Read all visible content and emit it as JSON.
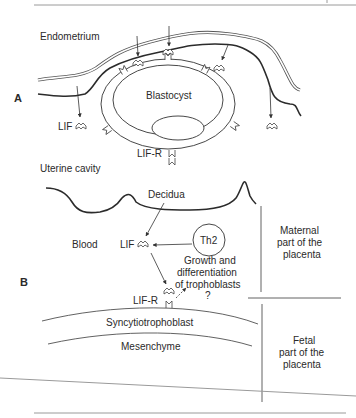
{
  "figure": {
    "panel_a": {
      "label": "A",
      "tissue_label": "Endometrium",
      "blastocyst_label": "Blastocyst",
      "lif_label": "LIF",
      "lif_r_label": "LIF-R"
    },
    "panel_b": {
      "label": "B",
      "cavity_label": "Uterine cavity",
      "decidua_label": "Decidua",
      "blood_label": "Blood",
      "lif_label": "LIF",
      "th2_label": "Th2",
      "growth_label_line1": "Growth and",
      "growth_label_line2": "differentiation",
      "growth_label_line3": "of trophoblasts",
      "question_mark": "?",
      "lif_r_label": "LIF-R",
      "syncytio_label": "Syncytiotrophoblast",
      "mesenchyme_label": "Mesenchyme",
      "maternal_line1": "Maternal",
      "maternal_line2": "part of the",
      "maternal_line3": "placenta",
      "fetal_line1": "Fetal",
      "fetal_line2": "part of the",
      "fetal_line3": "placenta"
    },
    "icons": {
      "lif": "lif-ligand-icon",
      "lif_r": "lif-receptor-icon",
      "arrow": "arrow-icon"
    },
    "colors": {
      "line": "#2b2b2b",
      "text": "#2a2a2a",
      "rule": "#9a9a9a",
      "background": "#ffffff"
    }
  }
}
